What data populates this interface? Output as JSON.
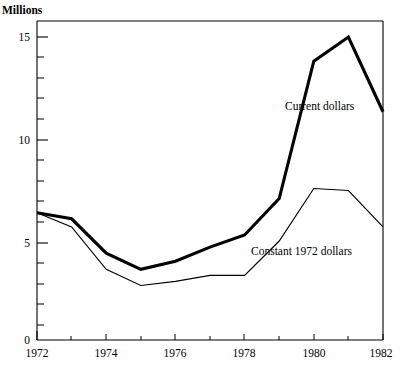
{
  "chart_data": {
    "type": "line",
    "title": "",
    "ylabel": "Millions",
    "xlabel": "",
    "x": [
      1972,
      1973,
      1974,
      1975,
      1976,
      1977,
      1978,
      1979,
      1980,
      1981,
      1982
    ],
    "xlim": [
      1972,
      1982
    ],
    "ylim": [
      0,
      16
    ],
    "grid": false,
    "legend_position": "inline-annotation",
    "y_major_ticks": [
      0,
      5,
      10,
      15
    ],
    "y_major_tick_labels": [
      "0",
      "5",
      "10",
      "15"
    ],
    "y_minor_tick_step": 1,
    "x_major_ticks": [
      1972,
      1974,
      1976,
      1978,
      1980,
      1982
    ],
    "x_major_tick_labels": [
      "1972",
      "1974",
      "1976",
      "1978",
      "1980",
      "1982"
    ],
    "x_minor_ticks": [
      1973,
      1975,
      1977,
      1979,
      1981
    ],
    "series": [
      {
        "name": "Current dollars",
        "style": "thick",
        "label_x": 1979.05,
        "label_y": 11.4,
        "values": [
          6.3,
          6.0,
          4.3,
          3.5,
          3.9,
          4.6,
          5.2,
          7.0,
          13.8,
          15.0,
          11.3
        ]
      },
      {
        "name": "Constant 1972 dollars",
        "style": "thin",
        "label_x": 1978.0,
        "label_y": 4.3,
        "values": [
          6.3,
          5.6,
          3.5,
          2.7,
          2.9,
          3.2,
          3.2,
          4.9,
          7.5,
          7.4,
          5.6
        ]
      }
    ],
    "annotations": [
      {
        "text": "Millions",
        "x": 1,
        "y": 10
      },
      {
        "text": "Current dollars",
        "x": 285,
        "y": 110
      },
      {
        "text": "Constant 1972 dollars",
        "x": 251,
        "y": 255
      }
    ],
    "colors": {
      "line": "#000000",
      "axis": "#000000",
      "background": "#ffffff"
    }
  },
  "axis": {
    "y_title": "Millions",
    "y_labels": [
      "15",
      "10",
      "5",
      "0"
    ],
    "x_labels": [
      "1972",
      "1974",
      "1976",
      "1978",
      "1980",
      "1982"
    ]
  },
  "labels": {
    "current_dollars": "Current dollars",
    "constant_dollars": "Constant 1972 dollars"
  }
}
